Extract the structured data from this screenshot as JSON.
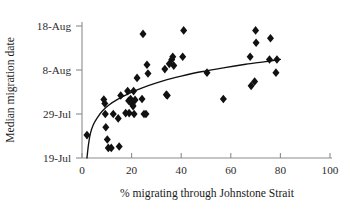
{
  "chart_data": {
    "type": "scatter",
    "title": "",
    "xlabel": "% migrating through Johnstone Strait",
    "ylabel": "Median migration date",
    "xlim": [
      0,
      100
    ],
    "xticks": [
      0,
      20,
      40,
      60,
      80,
      100
    ],
    "xticklabels": [
      "0",
      "20",
      "40",
      "60",
      "80",
      "100"
    ],
    "ylim_days": [
      0,
      30
    ],
    "yticks_days": [
      0,
      10,
      20,
      30
    ],
    "yticklabels": [
      "19-Jul",
      "29-Jul",
      "8-Aug",
      "18-Aug"
    ],
    "grid": false,
    "legend": false,
    "marker": "diamond",
    "marker_color": "#111111",
    "points": [
      {
        "x": 2.0,
        "y_date": "24-Jul",
        "y_days": 5.2
      },
      {
        "x": 8.8,
        "y_date": "1-Aug",
        "y_days": 13.3
      },
      {
        "x": 9.2,
        "y_date": "31-Jul",
        "y_days": 12.4
      },
      {
        "x": 9.4,
        "y_date": "29-Jul",
        "y_days": 10.0
      },
      {
        "x": 9.6,
        "y_date": "26-Jul",
        "y_days": 7.0
      },
      {
        "x": 10.2,
        "y_date": "23-Jul",
        "y_days": 4.2
      },
      {
        "x": 10.6,
        "y_date": "21-Jul",
        "y_days": 2.3
      },
      {
        "x": 11.8,
        "y_date": "21-Jul",
        "y_days": 2.3
      },
      {
        "x": 12.6,
        "y_date": "29-Jul",
        "y_days": 10.0
      },
      {
        "x": 14.6,
        "y_date": "28-Jul",
        "y_days": 9.0
      },
      {
        "x": 15.0,
        "y_date": "21-Jul",
        "y_days": 2.6
      },
      {
        "x": 15.6,
        "y_date": "2-Aug",
        "y_days": 14.2
      },
      {
        "x": 17.6,
        "y_date": "29-Jul",
        "y_days": 10.2
      },
      {
        "x": 18.4,
        "y_date": "3-Aug",
        "y_days": 15.2
      },
      {
        "x": 18.8,
        "y_date": "1-Aug",
        "y_days": 13.0
      },
      {
        "x": 19.0,
        "y_date": "29-Jul",
        "y_days": 10.2
      },
      {
        "x": 19.6,
        "y_date": "1-Aug",
        "y_days": 13.4
      },
      {
        "x": 20.2,
        "y_date": "31-Jul",
        "y_days": 12.2
      },
      {
        "x": 20.6,
        "y_date": "31-Jul",
        "y_days": 11.8
      },
      {
        "x": 20.8,
        "y_date": "3-Aug",
        "y_days": 15.2
      },
      {
        "x": 21.0,
        "y_date": "29-Jul",
        "y_days": 10.0
      },
      {
        "x": 21.4,
        "y_date": "1-Aug",
        "y_days": 13.2
      },
      {
        "x": 22.2,
        "y_date": "6-Aug",
        "y_days": 18.2
      },
      {
        "x": 24.2,
        "y_date": "1-Aug",
        "y_days": 13.4
      },
      {
        "x": 24.6,
        "y_date": "16-Aug",
        "y_days": 28.2
      },
      {
        "x": 25.0,
        "y_date": "29-Jul",
        "y_days": 10.0
      },
      {
        "x": 25.8,
        "y_date": "29-Jul",
        "y_days": 10.0
      },
      {
        "x": 26.2,
        "y_date": "9-Aug",
        "y_days": 21.2
      },
      {
        "x": 26.6,
        "y_date": "7-Aug",
        "y_days": 19.2
      },
      {
        "x": 33.4,
        "y_date": "8-Aug",
        "y_days": 20.2
      },
      {
        "x": 34.0,
        "y_date": "2-Aug",
        "y_days": 14.4
      },
      {
        "x": 34.4,
        "y_date": "2-Aug",
        "y_days": 14.2
      },
      {
        "x": 35.2,
        "y_date": "9-Aug",
        "y_days": 21.4
      },
      {
        "x": 36.2,
        "y_date": "10-Aug",
        "y_days": 22.4
      },
      {
        "x": 36.6,
        "y_date": "11-Aug",
        "y_days": 23.0
      },
      {
        "x": 37.0,
        "y_date": "9-Aug",
        "y_days": 21.0
      },
      {
        "x": 40.6,
        "y_date": "11-Aug",
        "y_days": 23.0
      },
      {
        "x": 41.0,
        "y_date": "17-Aug",
        "y_days": 29.0
      },
      {
        "x": 50.4,
        "y_date": "7-Aug",
        "y_days": 19.4
      },
      {
        "x": 57.0,
        "y_date": "1-Aug",
        "y_days": 13.4
      },
      {
        "x": 67.8,
        "y_date": "11-Aug",
        "y_days": 23.0
      },
      {
        "x": 68.2,
        "y_date": "4-Aug",
        "y_days": 16.4
      },
      {
        "x": 69.6,
        "y_date": "5-Aug",
        "y_days": 17.4
      },
      {
        "x": 70.0,
        "y_date": "17-Aug",
        "y_days": 29.0
      },
      {
        "x": 70.2,
        "y_date": "14-Aug",
        "y_days": 26.2
      },
      {
        "x": 75.6,
        "y_date": "10-Aug",
        "y_days": 22.4
      },
      {
        "x": 76.0,
        "y_date": "15-Aug",
        "y_days": 27.2
      },
      {
        "x": 78.2,
        "y_date": "7-Aug",
        "y_days": 19.4
      },
      {
        "x": 78.6,
        "y_date": "10-Aug",
        "y_days": 22.4
      }
    ],
    "fit_curve": {
      "shape": "logarithmic",
      "note": "monotonic increasing log fit rising steeply near x=2 and flattening after x=40",
      "points": [
        {
          "x": 2.0,
          "y_days": 0.0
        },
        {
          "x": 2.6,
          "y_days": 3.0
        },
        {
          "x": 3.4,
          "y_days": 5.6
        },
        {
          "x": 4.6,
          "y_days": 7.6
        },
        {
          "x": 6.2,
          "y_days": 9.2
        },
        {
          "x": 8.4,
          "y_days": 10.8
        },
        {
          "x": 11.0,
          "y_days": 12.1
        },
        {
          "x": 14.0,
          "y_days": 13.2
        },
        {
          "x": 18.0,
          "y_days": 14.4
        },
        {
          "x": 22.0,
          "y_days": 15.4
        },
        {
          "x": 27.0,
          "y_days": 16.5
        },
        {
          "x": 33.0,
          "y_days": 17.6
        },
        {
          "x": 40.0,
          "y_days": 18.6
        },
        {
          "x": 48.0,
          "y_days": 19.6
        },
        {
          "x": 57.0,
          "y_days": 20.5
        },
        {
          "x": 66.0,
          "y_days": 21.3
        },
        {
          "x": 74.0,
          "y_days": 21.9
        },
        {
          "x": 80.0,
          "y_days": 22.4
        }
      ]
    }
  }
}
